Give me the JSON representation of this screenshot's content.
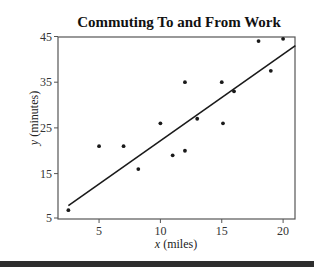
{
  "chart_data": {
    "type": "scatter",
    "title": "Commuting To and From Work",
    "xlabel_var": "x",
    "xlabel_unit": " (miles)",
    "ylabel_var": "y",
    "ylabel_unit": " (minutes)",
    "xlim": [
      2,
      21
    ],
    "ylim": [
      4.5,
      45.5
    ],
    "xticks": [
      5,
      10,
      15,
      20
    ],
    "yticks": [
      5,
      15,
      25,
      35,
      45
    ],
    "grid": false,
    "legend": null,
    "points": [
      {
        "x": 2.5,
        "y": 7
      },
      {
        "x": 5,
        "y": 21
      },
      {
        "x": 7,
        "y": 21
      },
      {
        "x": 8.2,
        "y": 16
      },
      {
        "x": 10,
        "y": 26
      },
      {
        "x": 11,
        "y": 19
      },
      {
        "x": 12,
        "y": 20
      },
      {
        "x": 12,
        "y": 35
      },
      {
        "x": 13,
        "y": 27
      },
      {
        "x": 15,
        "y": 35
      },
      {
        "x": 15.1,
        "y": 26
      },
      {
        "x": 16,
        "y": 33
      },
      {
        "x": 18,
        "y": 44
      },
      {
        "x": 19,
        "y": 37.5
      },
      {
        "x": 20,
        "y": 44.5
      }
    ],
    "regression_line": {
      "x1": 2.5,
      "y1": 8,
      "x2": 21,
      "y2": 43
    }
  },
  "colors": {
    "points": "#1a1a1a",
    "line": "#1a1a1a",
    "frame": "#555555",
    "bottom_bar": "#2e2e2e"
  }
}
